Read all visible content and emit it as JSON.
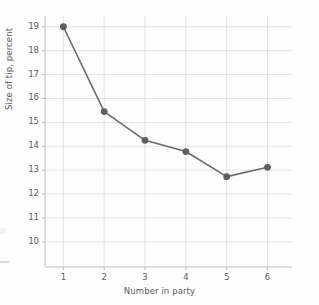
{
  "chart_data": {
    "type": "line",
    "title": "",
    "xlabel": "Number in party",
    "ylabel": "Size of tip, percent",
    "x": [
      1,
      2,
      3,
      4,
      5,
      6
    ],
    "values": [
      19.0,
      15.45,
      14.25,
      13.78,
      12.73,
      13.12
    ],
    "categories": [
      "1",
      "2",
      "3",
      "4",
      "5",
      "6"
    ],
    "xtick_labels": [
      "1",
      "2",
      "3",
      "4",
      "5",
      "6"
    ],
    "ytick_labels": [
      "10",
      "11",
      "12",
      "13",
      "14",
      "15",
      "16",
      "17",
      "18",
      "19"
    ],
    "ytick_values": [
      10,
      11,
      12,
      13,
      14,
      15,
      16,
      17,
      18,
      19
    ],
    "xlim": [
      0.55,
      6.6
    ],
    "ylim": [
      8.95,
      19.45
    ],
    "grid": true,
    "legend": null,
    "series": [
      {
        "name": "Size of tip, percent",
        "values": [
          19.0,
          15.45,
          14.25,
          13.78,
          12.73,
          13.12
        ]
      }
    ],
    "colors": {
      "line": "#6b6b6b",
      "marker": "#5f5f5f",
      "grid": "#e3e3e3",
      "axis": "#bdbdbd",
      "text": "#5c5c5c",
      "background": "#fdfdfd"
    },
    "marker": "circle",
    "line_width": 1.6,
    "marker_size": 3.4
  }
}
